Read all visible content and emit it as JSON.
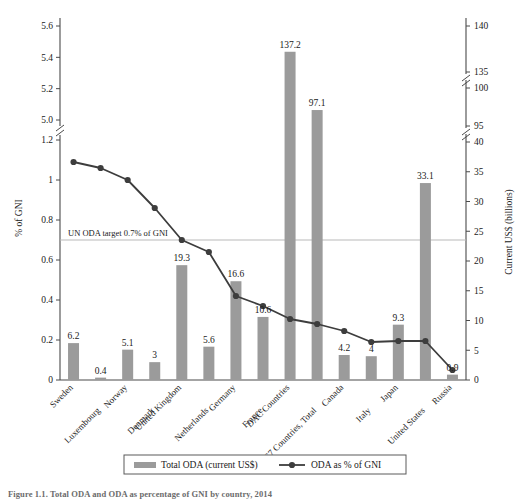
{
  "figure": {
    "caption": "Figure 1.1.  Total ODA and ODA as percentage of GNI by country, 2014",
    "bar_color": "#9b9b9b",
    "line_color": "#3d3d3d",
    "axis_color": "#4a4a4a",
    "target_line_color": "#b9b9b9"
  },
  "chart_data": {
    "type": "bar",
    "title": "",
    "subtitle": "",
    "xlabel": "",
    "ylabel": "% of GNI",
    "y2label": "Current US$ (billions)",
    "grid": false,
    "legend_position": "bottom",
    "categories": [
      "Sweden",
      "Luxembourg",
      "Norway",
      "Denmark",
      "United Kingdom",
      "Netherlands",
      "Germany",
      "France",
      "DAC Countries",
      "G7 Countries, Total",
      "Canada",
      "Italy",
      "Japan",
      "United States",
      "Russia"
    ],
    "series": [
      {
        "name": "Total ODA (current US$)",
        "type": "bar",
        "axis": "right",
        "unit": "US$ billions",
        "values": [
          6.2,
          0.4,
          5.1,
          3,
          19.3,
          5.6,
          16.6,
          10.6,
          137.2,
          97.1,
          4.2,
          4,
          9.3,
          33.1,
          0.9
        ],
        "labels": [
          "6.2",
          "0.4",
          "5.1",
          "3",
          "19.3",
          "5.6",
          "16.6",
          "10.6",
          "137.2",
          "97.1",
          "4.2",
          "4",
          "9.3",
          "33.1",
          "0.9"
        ]
      },
      {
        "name": "ODA as % of GNI",
        "type": "line",
        "axis": "left",
        "unit": "% of GNI",
        "values": [
          1.09,
          1.06,
          1.0,
          0.86,
          0.7,
          0.64,
          0.42,
          0.37,
          0.305,
          0.28,
          0.245,
          0.19,
          0.195,
          0.195,
          0.05
        ]
      }
    ],
    "left_axis": {
      "label": "% of GNI",
      "ticks": [
        "0",
        "0.2",
        "0.4",
        "0.6",
        "0.8",
        "1",
        "1.2",
        "5.0",
        "5.2",
        "5.4",
        "5.6"
      ],
      "broken": true,
      "break_between": [
        "1.2",
        "5.0"
      ]
    },
    "right_axis": {
      "label": "Current US$ (billions)",
      "ticks": [
        "0",
        "5",
        "10",
        "15",
        "20",
        "25",
        "30",
        "35",
        "40",
        "95",
        "100",
        "135",
        "140"
      ],
      "broken": true,
      "breaks": [
        [
          "40",
          "95"
        ],
        [
          "100",
          "135"
        ]
      ]
    },
    "annotations": [
      {
        "text": "UN ODA target 0.7% of GNI",
        "y_value": 0.7,
        "kind": "horizontal-reference-line"
      }
    ],
    "legend": [
      {
        "label": "Total ODA (current US$)",
        "marker": "bar"
      },
      {
        "label": "ODA as % of GNI",
        "marker": "line-dot"
      }
    ]
  }
}
